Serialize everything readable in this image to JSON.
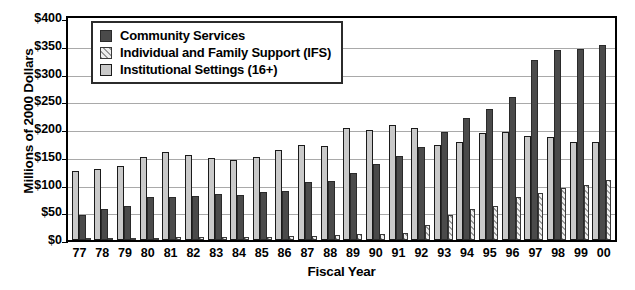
{
  "chart_data": {
    "type": "bar",
    "title": "",
    "xlabel": "Fiscal Year",
    "ylabel": "Millions of 2000 Dollars",
    "ylim": [
      0,
      400
    ],
    "ytick_labels": [
      "$400",
      "$350",
      "$300",
      "$250",
      "$200",
      "$150",
      "$100",
      "$50",
      "$0"
    ],
    "ytick_values": [
      400,
      350,
      300,
      250,
      200,
      150,
      100,
      50,
      0
    ],
    "grid": true,
    "legend_position": "top-left-inside",
    "categories": [
      "77",
      "78",
      "79",
      "80",
      "81",
      "82",
      "83",
      "84",
      "85",
      "86",
      "87",
      "88",
      "89",
      "90",
      "91",
      "92",
      "93",
      "94",
      "95",
      "96",
      "97",
      "98",
      "99",
      "00"
    ],
    "bar_draw_order": [
      "Institutional Settings (16+)",
      "Community Services",
      "Individual and Family Support (IFS)"
    ],
    "series": [
      {
        "name": "Institutional Settings (16+)",
        "key": "inst",
        "color": "#c9c9c9",
        "values": [
          125,
          128,
          134,
          150,
          158,
          154,
          148,
          145,
          149,
          163,
          171,
          169,
          201,
          198,
          208,
          201,
          172,
          177,
          192,
          194,
          188,
          186,
          176,
          176
        ]
      },
      {
        "name": "Community Services",
        "key": "comm",
        "color": "#4a4a4a",
        "values": [
          45,
          55,
          62,
          78,
          77,
          80,
          83,
          82,
          86,
          88,
          104,
          106,
          120,
          137,
          151,
          168,
          195,
          220,
          236,
          258,
          325,
          342,
          344,
          352
        ]
      },
      {
        "name": "Individual and Family Support (IFS)",
        "key": "ifs",
        "color": "#e8e8e8",
        "values": [
          2,
          3,
          3,
          4,
          5,
          5,
          5,
          6,
          6,
          7,
          8,
          9,
          10,
          11,
          12,
          27,
          45,
          56,
          62,
          78,
          85,
          93,
          100,
          108
        ]
      }
    ]
  },
  "legend": {
    "items": [
      {
        "label": "Community Services",
        "key": "comm"
      },
      {
        "label": "Individual and Family Support (IFS)",
        "key": "ifs"
      },
      {
        "label": "Institutional Settings (16+)",
        "key": "inst"
      }
    ]
  }
}
